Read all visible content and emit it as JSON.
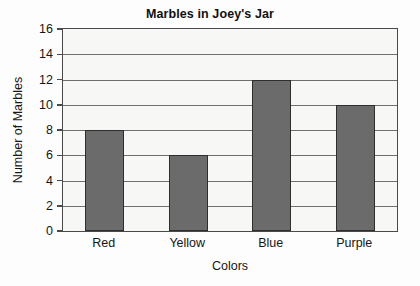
{
  "chart_data": {
    "type": "bar",
    "title": "Marbles in Joey's Jar",
    "xlabel": "Colors",
    "ylabel": "Number of Marbles",
    "categories": [
      "Red",
      "Yellow",
      "Blue",
      "Purple"
    ],
    "values": [
      8,
      6,
      12,
      10
    ],
    "ylim": [
      0,
      16
    ],
    "ytick_values": [
      0,
      2,
      4,
      6,
      8,
      10,
      12,
      14,
      16
    ],
    "ytick_labels": [
      "0",
      "2",
      "4",
      "6",
      "8",
      "10",
      "12",
      "14",
      "16"
    ],
    "grid": "horizontal",
    "legend": "none",
    "colors": {
      "bar_fill": "#6b6b6b",
      "bar_edge": "#2e2e2e",
      "plot_background": "#f7f7f5",
      "frame": "#4a4a4a",
      "gridline": "#6f6f6f",
      "text": "#161616",
      "figure_background": "#fdfdfd"
    }
  }
}
